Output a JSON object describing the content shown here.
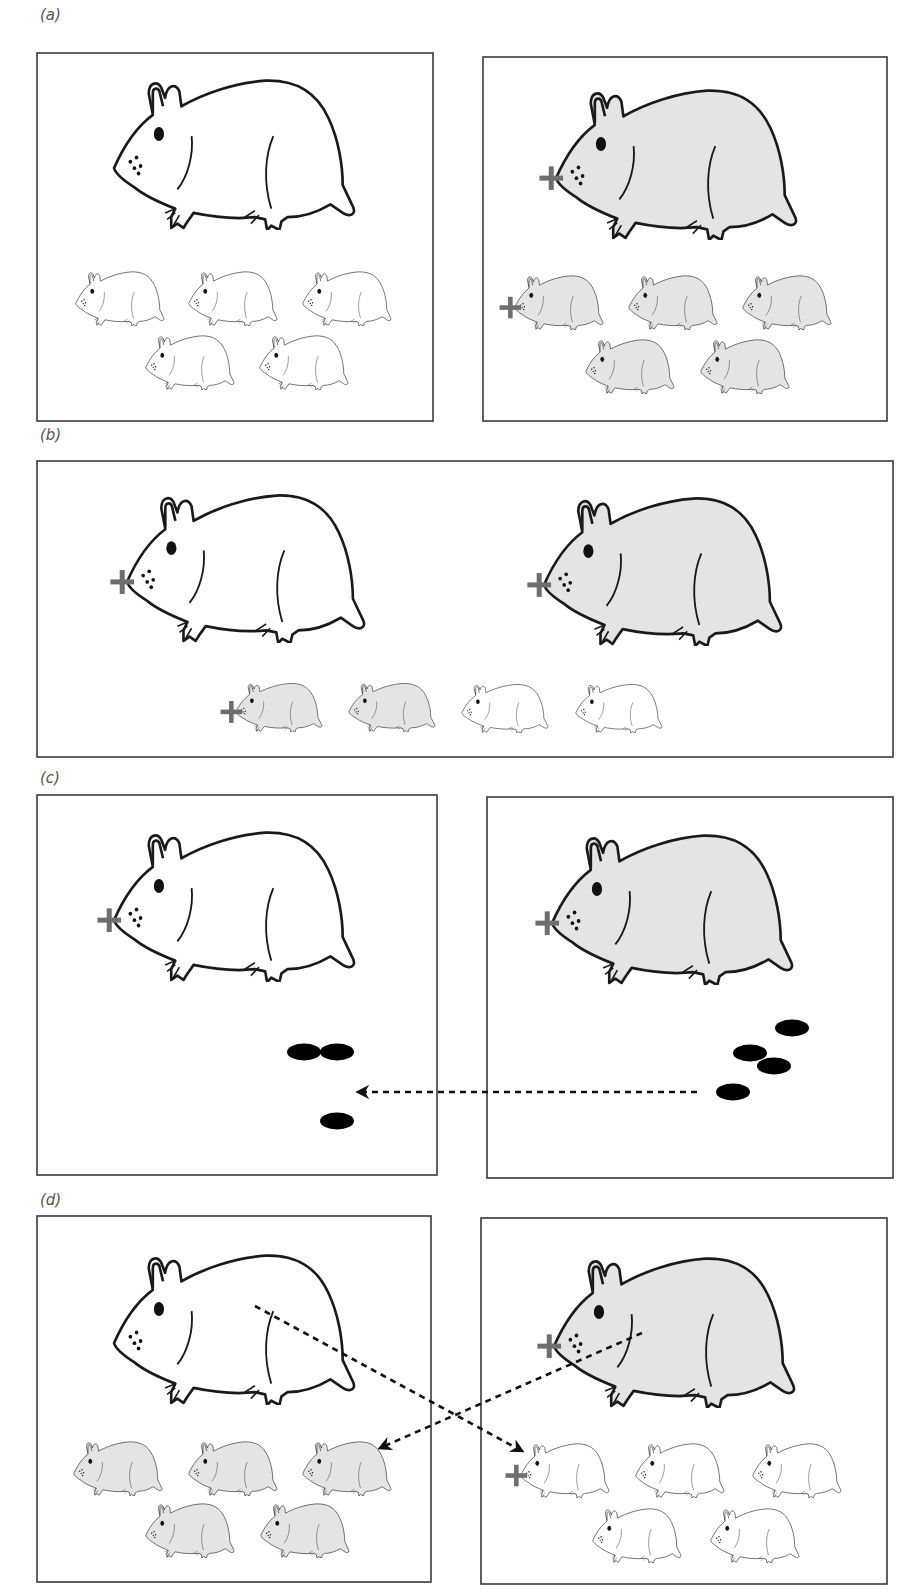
{
  "figure": {
    "colors": {
      "outline": "#1a1a1a",
      "grey_fill": "#e4e4e4",
      "white_fill": "#ffffff",
      "cross_marker": "#6e6e6e",
      "pellet": "#000000",
      "box_border": "#3a3a3a",
      "label": "#555555"
    },
    "panels": [
      {
        "id": "a",
        "label": "(a)",
        "label_pos": [
          40,
          20
        ],
        "boxes": [
          {
            "rect": [
              37,
              53,
              396,
              368
            ],
            "adults": [
              {
                "x": 112,
                "y": 70,
                "w": 245,
                "h": 160,
                "fill": "white",
                "cross": false
              }
            ],
            "pups": [
              {
                "x": 75,
                "y": 268,
                "w": 90,
                "h": 58,
                "fill": "white",
                "cross": false
              },
              {
                "x": 188,
                "y": 268,
                "w": 90,
                "h": 58,
                "fill": "white",
                "cross": false
              },
              {
                "x": 302,
                "y": 268,
                "w": 90,
                "h": 58,
                "fill": "white",
                "cross": false
              },
              {
                "x": 145,
                "y": 332,
                "w": 90,
                "h": 58,
                "fill": "white",
                "cross": false
              },
              {
                "x": 259,
                "y": 332,
                "w": 90,
                "h": 58,
                "fill": "white",
                "cross": false
              }
            ]
          },
          {
            "rect": [
              483,
              57,
              404,
              364
            ],
            "adults": [
              {
                "x": 554,
                "y": 80,
                "w": 245,
                "h": 160,
                "fill": "grey",
                "cross": true
              }
            ],
            "pups": [
              {
                "x": 514,
                "y": 272,
                "w": 90,
                "h": 58,
                "fill": "grey",
                "cross": true
              },
              {
                "x": 628,
                "y": 272,
                "w": 90,
                "h": 58,
                "fill": "grey",
                "cross": false
              },
              {
                "x": 742,
                "y": 272,
                "w": 90,
                "h": 58,
                "fill": "grey",
                "cross": false
              },
              {
                "x": 585,
                "y": 336,
                "w": 90,
                "h": 58,
                "fill": "grey",
                "cross": false
              },
              {
                "x": 700,
                "y": 336,
                "w": 90,
                "h": 58,
                "fill": "grey",
                "cross": false
              }
            ]
          }
        ]
      },
      {
        "id": "b",
        "label": "(b)",
        "label_pos": [
          40,
          440
        ],
        "boxes": [
          {
            "rect": [
              37,
              461,
              856,
              296
            ],
            "adults": [
              {
                "x": 125,
                "y": 485,
                "w": 242,
                "h": 158,
                "fill": "white",
                "cross": true
              },
              {
                "x": 542,
                "y": 488,
                "w": 242,
                "h": 158,
                "fill": "grey",
                "cross": true
              }
            ],
            "pups": [
              {
                "x": 235,
                "y": 680,
                "w": 88,
                "h": 52,
                "fill": "grey",
                "cross": true
              },
              {
                "x": 348,
                "y": 680,
                "w": 88,
                "h": 52,
                "fill": "grey",
                "cross": false
              },
              {
                "x": 461,
                "y": 681,
                "w": 88,
                "h": 52,
                "fill": "white",
                "cross": false
              },
              {
                "x": 575,
                "y": 681,
                "w": 88,
                "h": 52,
                "fill": "white",
                "cross": false
              }
            ]
          }
        ]
      },
      {
        "id": "c",
        "label": "(c)",
        "label_pos": [
          40,
          783
        ],
        "boxes": [
          {
            "rect": [
              37,
              795,
              400,
              380
            ],
            "adults": [
              {
                "x": 112,
                "y": 822,
                "w": 245,
                "h": 160,
                "fill": "white",
                "cross": true
              }
            ],
            "pellets": [
              [
                304,
                1052
              ],
              [
                337,
                1052
              ],
              [
                337,
                1121
              ]
            ]
          },
          {
            "rect": [
              487,
              797,
              406,
              381
            ],
            "adults": [
              {
                "x": 550,
                "y": 825,
                "w": 245,
                "h": 160,
                "fill": "grey",
                "cross": true
              }
            ],
            "pellets": [
              [
                792,
                1028
              ],
              [
                750,
                1053
              ],
              [
                774,
                1066
              ],
              [
                733,
                1092
              ]
            ]
          }
        ],
        "arrows": [
          {
            "from": [
              697,
              1092
            ],
            "to": [
              358,
              1092
            ],
            "meaning": "pellets moved from right cage to left cage"
          }
        ]
      },
      {
        "id": "d",
        "label": "(d)",
        "label_pos": [
          40,
          1205
        ],
        "boxes": [
          {
            "rect": [
              37,
              1216,
              394,
              366
            ],
            "adults": [
              {
                "x": 112,
                "y": 1245,
                "w": 245,
                "h": 160,
                "fill": "white",
                "cross": false
              }
            ],
            "pups": [
              {
                "x": 73,
                "y": 1438,
                "w": 90,
                "h": 58,
                "fill": "grey",
                "cross": false
              },
              {
                "x": 188,
                "y": 1438,
                "w": 90,
                "h": 58,
                "fill": "grey",
                "cross": false
              },
              {
                "x": 302,
                "y": 1438,
                "w": 90,
                "h": 58,
                "fill": "grey",
                "cross": false
              },
              {
                "x": 145,
                "y": 1500,
                "w": 90,
                "h": 58,
                "fill": "grey",
                "cross": false
              },
              {
                "x": 260,
                "y": 1500,
                "w": 90,
                "h": 58,
                "fill": "grey",
                "cross": false
              }
            ]
          },
          {
            "rect": [
              481,
              1218,
              406,
              366
            ],
            "adults": [
              {
                "x": 552,
                "y": 1248,
                "w": 245,
                "h": 160,
                "fill": "grey",
                "cross": true
              }
            ],
            "pups": [
              {
                "x": 520,
                "y": 1440,
                "w": 90,
                "h": 58,
                "fill": "white",
                "cross": true
              },
              {
                "x": 635,
                "y": 1440,
                "w": 90,
                "h": 58,
                "fill": "white",
                "cross": false
              },
              {
                "x": 752,
                "y": 1440,
                "w": 90,
                "h": 58,
                "fill": "white",
                "cross": false
              },
              {
                "x": 592,
                "y": 1505,
                "w": 90,
                "h": 58,
                "fill": "white",
                "cross": false
              },
              {
                "x": 710,
                "y": 1505,
                "w": 90,
                "h": 58,
                "fill": "white",
                "cross": false
              }
            ]
          }
        ],
        "arrows": [
          {
            "from": [
              255,
              1306
            ],
            "to": [
              522,
              1451
            ],
            "meaning": "white adult to white pups (right cage)"
          },
          {
            "from": [
              642,
              1333
            ],
            "to": [
              380,
              1448
            ],
            "meaning": "grey adult to grey pups (left cage)"
          }
        ]
      }
    ]
  }
}
